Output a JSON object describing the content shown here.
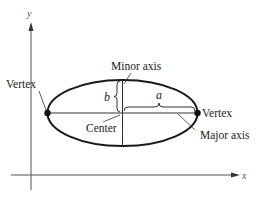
{
  "diagram": {
    "axes": {
      "x_label": "x",
      "y_label": "y"
    },
    "labels": {
      "minor_axis": "Minor axis",
      "major_axis": "Major axis",
      "center": "Center",
      "vertex_left": "Vertex",
      "vertex_right": "Vertex",
      "semi_minor": "b",
      "semi_major": "a"
    },
    "colors": {
      "stroke": "#1a1a1a",
      "axis": "#555555",
      "background": "#ffffff"
    }
  }
}
